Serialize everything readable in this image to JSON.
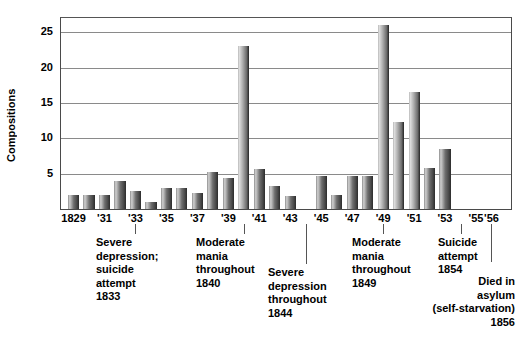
{
  "chart_data": {
    "type": "bar",
    "title": "",
    "xlabel": "",
    "ylabel": "Compositions",
    "ylim": [
      0,
      27
    ],
    "yticks": [
      5,
      10,
      15,
      20,
      25
    ],
    "grid": true,
    "legend_position": "none",
    "x_tick_labels": [
      "1829",
      "'31",
      "'33",
      "'35",
      "'37",
      "'39",
      "'41",
      "'43",
      "'45",
      "'47",
      "'49",
      "'51",
      "'53",
      "'55",
      "'56"
    ],
    "categories": [
      "1829",
      "1830",
      "1831",
      "1832",
      "1833",
      "1834",
      "1835",
      "1836",
      "1837",
      "1838",
      "1839",
      "1840",
      "1841",
      "1842",
      "1843",
      "1844",
      "1845",
      "1846",
      "1847",
      "1848",
      "1849",
      "1850",
      "1851",
      "1852",
      "1853",
      "1854",
      "1855",
      "1856"
    ],
    "values": [
      2,
      2,
      2,
      4,
      2.5,
      1,
      3,
      3,
      2.2,
      5.2,
      4.4,
      23,
      5.7,
      3.2,
      1.8,
      0,
      4.7,
      2,
      4.7,
      4.7,
      26,
      12.3,
      16.6,
      5.8,
      8.5,
      0,
      0,
      0
    ],
    "annotations": [
      {
        "year": "1833",
        "text": "Severe\ndepression;\nsuicide\nattempt\n1833",
        "align": "left"
      },
      {
        "year": "1840",
        "text": "Moderate\nmania\nthroughout\n1840",
        "align": "left"
      },
      {
        "year": "1844",
        "text": "Severe\ndepression\nthroughout\n1844",
        "align": "left"
      },
      {
        "year": "1849",
        "text": "Moderate\nmania\nthroughout\n1849",
        "align": "left"
      },
      {
        "year": "1854",
        "text": "Suicide\nattempt\n1854",
        "align": "left"
      },
      {
        "year": "1856",
        "text": "Died in\nasylum\n(self-starvation)\n1856",
        "align": "right"
      }
    ],
    "colors": {
      "bar_light": "#cfcfcf",
      "bar_dark": "#2b2b2b",
      "grid": "#8a8a8a",
      "axis": "#4a4a4a",
      "text": "#000000"
    }
  },
  "yticks": [
    {
      "label": "25"
    },
    {
      "label": "20"
    },
    {
      "label": "15"
    },
    {
      "label": "10"
    },
    {
      "label": "5"
    }
  ],
  "xticks": [
    {
      "label": "1829"
    },
    {
      "label": "'31"
    },
    {
      "label": "'33"
    },
    {
      "label": "'35"
    },
    {
      "label": "'37"
    },
    {
      "label": "'39"
    },
    {
      "label": "'41"
    },
    {
      "label": "'43"
    },
    {
      "label": "'45"
    },
    {
      "label": "'47"
    },
    {
      "label": "'49"
    },
    {
      "label": "'51"
    },
    {
      "label": "'53"
    },
    {
      "label": "'55"
    },
    {
      "label": "'56"
    }
  ],
  "annotations": [
    {
      "text": "Severe\ndepression;\nsuicide\nattempt\n1833"
    },
    {
      "text": "Moderate\nmania\nthroughout\n1840"
    },
    {
      "text": "Severe\ndepression\nthroughout\n1844"
    },
    {
      "text": "Moderate\nmania\nthroughout\n1849"
    },
    {
      "text": "Suicide\nattempt\n1854"
    },
    {
      "text": "Died in\nasylum\n(self-starvation)\n1856"
    }
  ]
}
